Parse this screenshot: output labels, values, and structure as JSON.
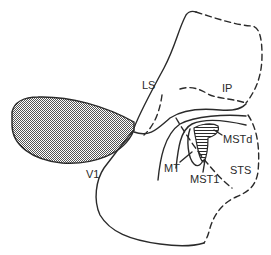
{
  "figure": {
    "labels": {
      "ls": "LS",
      "ip": "IP",
      "v1": "V1",
      "mt": "MT",
      "mstd": "MSTd",
      "mstl": "MST1",
      "sts": "STS"
    },
    "colors": {
      "line": "#2a2a2a",
      "background": "#ffffff",
      "v1_fill_dot": "#555555"
    }
  }
}
